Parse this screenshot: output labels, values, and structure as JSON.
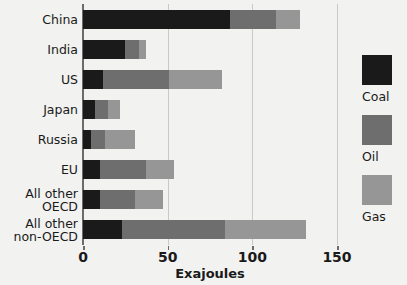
{
  "chart_data": {
    "type": "bar",
    "orientation": "horizontal",
    "stacked": true,
    "title": "",
    "xlabel": "Exajoules",
    "ylabel": "",
    "xlim": [
      0,
      150
    ],
    "xticks": [
      0,
      50,
      100,
      150
    ],
    "xtick_labels": [
      "0",
      "50",
      "100",
      "150"
    ],
    "grid": "vertical",
    "legend_position": "right",
    "categories": [
      "China",
      "India",
      "US",
      "Japan",
      "Russia",
      "EU",
      "All other\nOECD",
      "All other\nnon-OECD"
    ],
    "series": [
      {
        "name": "Coal",
        "color": "#1a1a1a",
        "values": [
          87,
          25,
          12,
          7,
          5,
          10,
          10,
          23
        ]
      },
      {
        "name": "Oil",
        "color": "#6e6e6e",
        "values": [
          27,
          8,
          39,
          8,
          8,
          27,
          21,
          61
        ]
      },
      {
        "name": "Gas",
        "color": "#969696",
        "values": [
          14,
          4,
          31,
          7,
          18,
          17,
          16,
          48
        ]
      }
    ],
    "totals": [
      128,
      37,
      82,
      22,
      31,
      54,
      47,
      132
    ]
  },
  "legend": {
    "items": [
      {
        "label": "Coal",
        "color": "#1a1a1a"
      },
      {
        "label": "Oil",
        "color": "#6e6e6e"
      },
      {
        "label": "Gas",
        "color": "#969696"
      }
    ]
  },
  "axis": {
    "x_title": "Exajoules"
  }
}
